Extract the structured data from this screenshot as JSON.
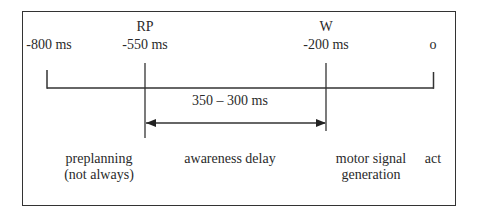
{
  "diagram": {
    "markers": [
      {
        "id": "start",
        "name": "",
        "time": "-800 ms"
      },
      {
        "id": "rp",
        "name": "RP",
        "time": "-550 ms"
      },
      {
        "id": "w",
        "name": "W",
        "time": "-200 ms"
      },
      {
        "id": "act",
        "name": "",
        "time": "o"
      }
    ],
    "interval": {
      "label": "350 – 300 ms",
      "from": "rp",
      "to": "w"
    },
    "phases": [
      {
        "line1": "preplanning",
        "line2": "(not always)"
      },
      {
        "line1": "awareness delay",
        "line2": ""
      },
      {
        "line1": "motor signal",
        "line2": "generation"
      },
      {
        "line1": "act",
        "line2": ""
      }
    ]
  }
}
